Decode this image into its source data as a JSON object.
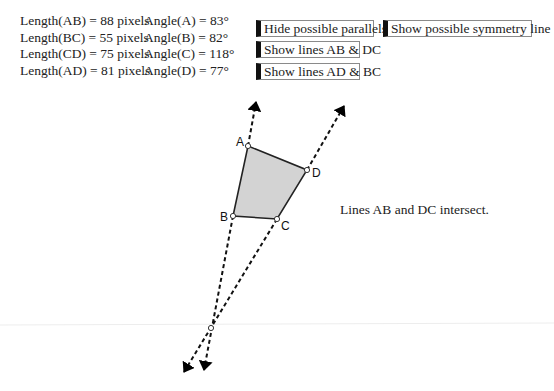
{
  "measurements": [
    {
      "length_label": "Length(AB) = 88 pixels",
      "angle_label": "Angle(A) = 83°"
    },
    {
      "length_label": "Length(BC) = 55 pixels",
      "angle_label": "Angle(B) = 82°"
    },
    {
      "length_label": "Length(CD) = 75 pixels",
      "angle_label": "Angle(C) = 118°"
    },
    {
      "length_label": "Length(AD) = 81 pixels",
      "angle_label": "Angle(D) = 77°"
    }
  ],
  "buttons": {
    "parallels": "Hide possible parallels",
    "symmetry": "Show possible symmetry line",
    "lines_ab_dc": "Show lines AB & DC",
    "lines_ad_bc": "Show lines AD & BC"
  },
  "status_message": "Lines AB and DC intersect.",
  "quadrilateral": {
    "vertices": [
      {
        "label": "A",
        "x": 248,
        "y": 146
      },
      {
        "label": "B",
        "x": 233,
        "y": 216
      },
      {
        "label": "C",
        "x": 277,
        "y": 219
      },
      {
        "label": "D",
        "x": 307,
        "y": 170
      }
    ],
    "fill_color": "#d3d3d3",
    "edge_color": "#222222"
  },
  "intersection_point": {
    "x": 211,
    "y": 328
  },
  "colors": {
    "button_accent": "#111111",
    "button_border": "#8a8a8a",
    "text": "#222222"
  }
}
